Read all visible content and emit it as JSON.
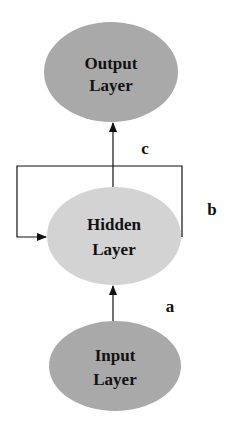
{
  "diagram": {
    "nodes": [
      {
        "id": "output",
        "line1": "Output",
        "line2": "Layer",
        "fill": "#a9a9a9"
      },
      {
        "id": "hidden",
        "line1": "Hidden",
        "line2": "Layer",
        "fill": "#d3d3d3"
      },
      {
        "id": "input",
        "line1": "Input",
        "line2": "Layer",
        "fill": "#a9a9a9"
      }
    ],
    "edges": [
      {
        "id": "a",
        "from": "input",
        "to": "hidden",
        "label": "a"
      },
      {
        "id": "b",
        "from": "hidden",
        "to": "hidden",
        "label": "b"
      },
      {
        "id": "c",
        "from": "hidden",
        "to": "output",
        "label": "c"
      }
    ],
    "line_color": "#111111"
  }
}
